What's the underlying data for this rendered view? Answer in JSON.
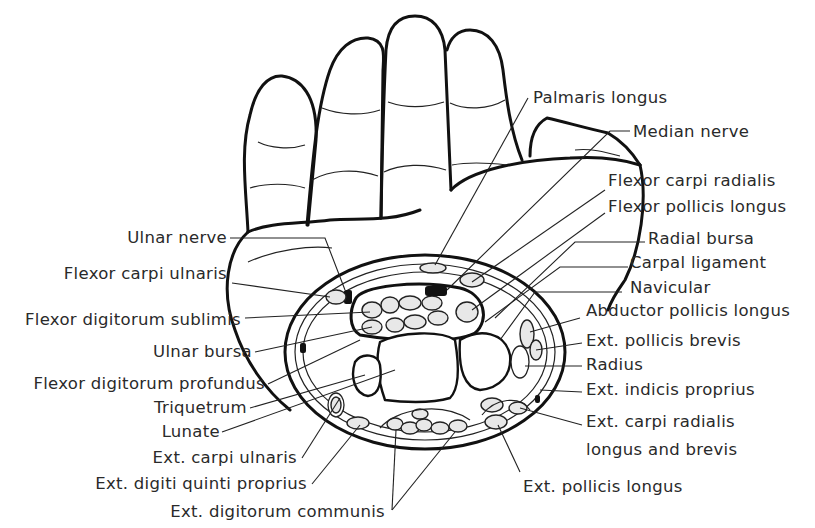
{
  "figure": {
    "left_labels": [
      {
        "id": "ulnar-nerve",
        "text": "Ulnar nerve"
      },
      {
        "id": "flexor-carpi-ulnaris",
        "text": "Flexor carpi ulnaris"
      },
      {
        "id": "flexor-digitorum-sublimis",
        "text": "Flexor digitorum sublimis"
      },
      {
        "id": "ulnar-bursa",
        "text": "Ulnar bursa"
      },
      {
        "id": "flexor-digitorum-profundus",
        "text": "Flexor digitorum profundus"
      },
      {
        "id": "triquetrum",
        "text": "Triquetrum"
      },
      {
        "id": "lunate",
        "text": "Lunate"
      },
      {
        "id": "ext-carpi-ulnaris",
        "text": "Ext. carpi ulnaris"
      },
      {
        "id": "ext-digiti-quinti-proprius",
        "text": "Ext. digiti quinti proprius"
      },
      {
        "id": "ext-digitorum-communis",
        "text": "Ext. digitorum communis"
      }
    ],
    "right_labels": [
      {
        "id": "palmaris-longus",
        "text": "Palmaris longus"
      },
      {
        "id": "median-nerve",
        "text": "Median nerve"
      },
      {
        "id": "flexor-carpi-radialis",
        "text": "Flexor carpi radialis"
      },
      {
        "id": "flexor-pollicis-longus",
        "text": "Flexor pollicis longus"
      },
      {
        "id": "radial-bursa",
        "text": "Radial bursa"
      },
      {
        "id": "carpal-ligament",
        "text": "Carpal ligament"
      },
      {
        "id": "navicular",
        "text": "Navicular"
      },
      {
        "id": "abductor-pollicis-longus",
        "text": "Abductor pollicis longus"
      },
      {
        "id": "ext-pollicis-brevis",
        "text": "Ext. pollicis brevis"
      },
      {
        "id": "radius",
        "text": "Radius"
      },
      {
        "id": "ext-indicis-proprius",
        "text": "Ext. indicis proprius"
      },
      {
        "id": "ext-carpi-radialis-line1",
        "text": "Ext. carpi radialis"
      },
      {
        "id": "ext-carpi-radialis-line2",
        "text": "longus and brevis"
      },
      {
        "id": "ext-pollicis-longus",
        "text": "Ext. pollicis longus"
      }
    ]
  }
}
